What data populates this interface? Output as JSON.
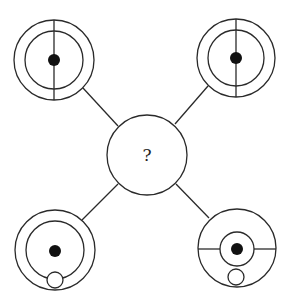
{
  "puzzle": {
    "question_mark": "?",
    "stroke_color": "#2a2a2a",
    "fill_color": "#111111",
    "figures": [
      {
        "position": "top-left",
        "description": "two concentric circles, central black dot, vertical diameter line"
      },
      {
        "position": "top-right",
        "description": "two concentric circles, central black dot, vertical diameter line"
      },
      {
        "position": "bottom-left",
        "description": "two concentric circles, central black dot, small circle at bottom"
      },
      {
        "position": "bottom-right",
        "description": "outer circle, small inner circle with black dot, horizontal diameter line, small circle at bottom"
      }
    ],
    "center": {
      "position": "center",
      "label": "?"
    }
  }
}
